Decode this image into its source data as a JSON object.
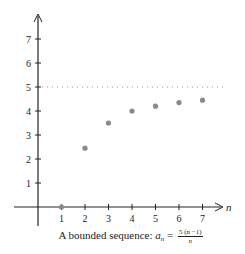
{
  "chart_data": {
    "type": "scatter",
    "title": "A bounded sequence",
    "caption_prefix": "A bounded sequence: ",
    "formula": {
      "lhs_var": "a",
      "lhs_sub": "n",
      "equals": " = ",
      "numerator": "5 (n −1)",
      "denominator": "n"
    },
    "xlabel": "n",
    "ylabel": "",
    "x": [
      1,
      2,
      3,
      4,
      5,
      6,
      7
    ],
    "y": [
      0,
      2.45,
      3.5,
      4.0,
      4.2,
      4.35,
      4.45
    ],
    "x_ticks": [
      "1",
      "2",
      "3",
      "4",
      "5",
      "6",
      "7"
    ],
    "y_ticks": [
      "1",
      "2",
      "3",
      "4",
      "5",
      "6",
      "7"
    ],
    "xlim": [
      -1,
      8
    ],
    "ylim": [
      -1,
      8
    ],
    "grid": false,
    "legend": null,
    "annotations": [
      {
        "type": "horizontal-dotted-line",
        "y": 5,
        "label": "upper bound"
      }
    ],
    "colors": {
      "points": "#8a8a8a",
      "axes": "#222222",
      "bound_line": "#9a9a9a"
    }
  }
}
